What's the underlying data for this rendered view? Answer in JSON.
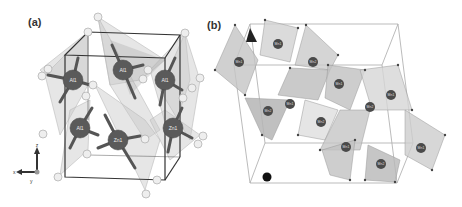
{
  "figure": {
    "panels": [
      {
        "id": "a",
        "label": "(a)",
        "description": "Unit cell with tetrahedrally coordinated cations",
        "cation_labels": [
          "Al1",
          "Al1",
          "Al1",
          "Al1",
          "Zn1",
          "Zn1"
        ],
        "oxygen_labels": [
          "O4",
          "O2",
          "O4",
          "O2",
          "O3",
          "O1",
          "O2",
          "O4",
          "O2",
          "O3",
          "O1",
          "O2",
          "O1",
          "O3",
          "O4",
          "O2",
          "O1",
          "O2",
          "O3",
          "O1"
        ],
        "axes": {
          "vertical": "z",
          "horizontal": "x",
          "depth": "y"
        }
      },
      {
        "id": "b",
        "label": "(b)",
        "description": "Unit cell with octahedral polyhedra",
        "cation_labels": [
          "Mn1",
          "Mn1",
          "Mn2",
          "Mn1",
          "Mn2",
          "Mn1",
          "Mn2",
          "Mn1",
          "Mn2",
          "Mn1",
          "Mn2",
          "Mn1"
        ],
        "axis_marker": "b"
      }
    ]
  },
  "colors": {
    "polyhedron_fill": "#c8c8c8",
    "polyhedron_dark": "#9a9a9a",
    "cation": "#555555",
    "oxygen_fill": "#eeeeee",
    "cell_edge_a": "#333333",
    "cell_edge_b": "#aaaaaa"
  }
}
